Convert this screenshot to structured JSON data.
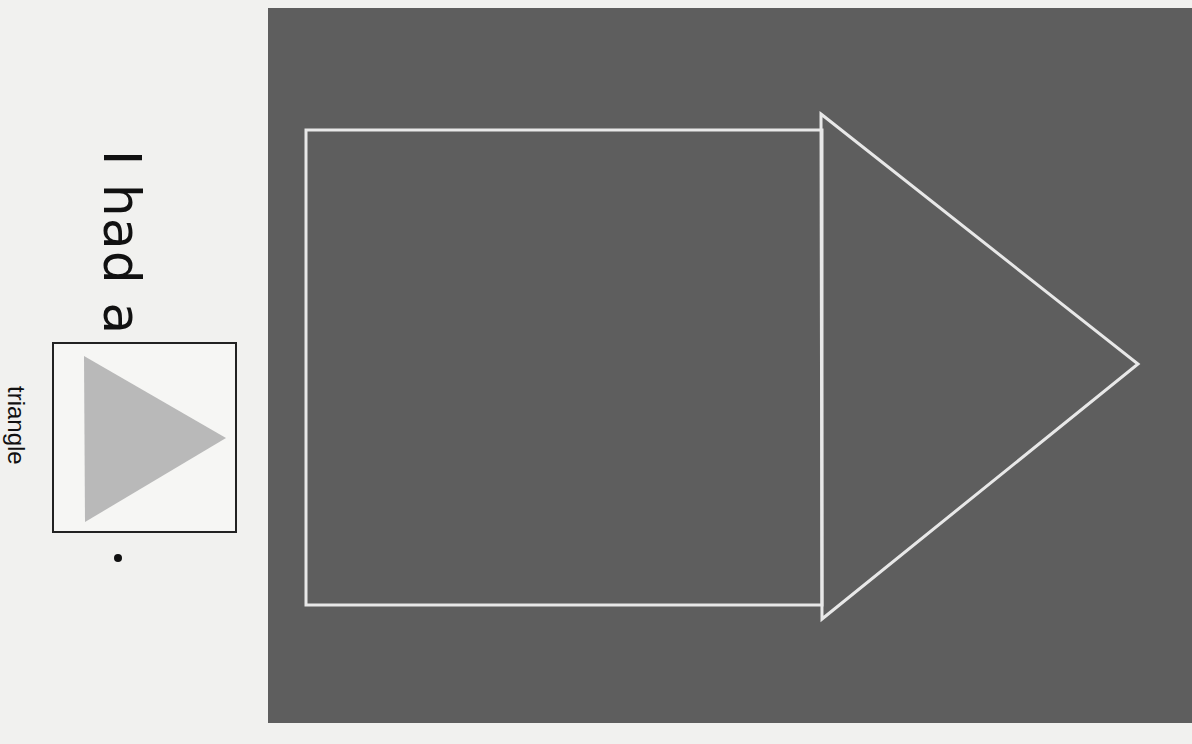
{
  "sentence": {
    "text": "I had a",
    "end_punctuation": "."
  },
  "picture_card": {
    "shape": "triangle",
    "label": "triangle",
    "fill_color": "#b9b9b9",
    "border_color": "#222222"
  },
  "drawing_panel": {
    "background_color": "#5e5e5e",
    "stroke_color": "#e8e8e8",
    "shapes": [
      {
        "type": "rectangle",
        "name": "square"
      },
      {
        "type": "triangle",
        "name": "triangle"
      }
    ]
  }
}
